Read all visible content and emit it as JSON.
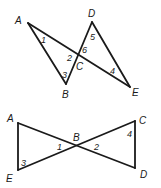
{
  "figures": [
    {
      "id": "top",
      "description": "Two triangles ABC and DCE sharing vertex C where segments AE and BD intersect",
      "vertices": {
        "A": {
          "label": "A",
          "x": 28,
          "y": 23
        },
        "B": {
          "label": "B",
          "x": 66,
          "y": 84
        },
        "C": {
          "label": "C",
          "x": 79,
          "y": 53
        },
        "D": {
          "label": "D",
          "x": 92,
          "y": 22
        },
        "E": {
          "label": "E",
          "x": 130,
          "y": 87
        }
      },
      "angles": {
        "a1": "1",
        "a2": "2",
        "a3": "3",
        "a4": "4",
        "a5": "5",
        "a6": "6"
      }
    },
    {
      "id": "bottom",
      "description": "Two triangles ABE and CBD sharing vertex B where segments AD and EC intersect",
      "vertices": {
        "A": {
          "label": "A",
          "x": 18,
          "y": 123
        },
        "B": {
          "label": "B",
          "x": 78,
          "y": 146
        },
        "C": {
          "label": "C",
          "x": 135,
          "y": 121
        },
        "D": {
          "label": "D",
          "x": 135,
          "y": 168
        },
        "E": {
          "label": "E",
          "x": 18,
          "y": 170
        }
      },
      "angles": {
        "a1": "1",
        "a2": "2",
        "a3": "3",
        "a4": "4"
      }
    }
  ]
}
